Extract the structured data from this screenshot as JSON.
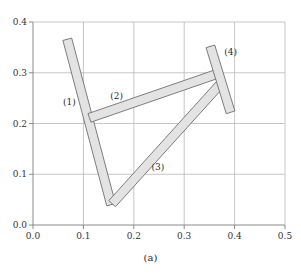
{
  "figure": {
    "caption": "(a)",
    "caption_x": 150,
    "caption_y": 252
  },
  "chart_data": {
    "type": "diagram",
    "title": "",
    "subtitle": "",
    "xlabel": "",
    "ylabel": "",
    "xlim": [
      0.0,
      0.5
    ],
    "ylim": [
      0.0,
      0.4
    ],
    "grid": true,
    "legend_position": "none",
    "xticks": [
      0.0,
      0.1,
      0.2,
      0.3,
      0.4,
      0.5
    ],
    "yticks": [
      0.0,
      0.1,
      0.2,
      0.3,
      0.4
    ],
    "xtick_labels": [
      "0.0",
      "0.1",
      "0.2",
      "0.3",
      "0.4",
      "0.5"
    ],
    "ytick_labels": [
      "0.0",
      "0.1",
      "0.2",
      "0.3",
      "0.4"
    ],
    "colors": {
      "bar_fill": "#e3e3e3",
      "bar_stroke": "#6f6f6f",
      "grid": "#b9b9b9",
      "axis": "#8a8a8a",
      "text": "#2b2b2b"
    },
    "bar_width": 0.018,
    "joints": [
      {
        "name": "A",
        "x": 0.118,
        "y": 0.205
      },
      {
        "name": "B",
        "x": 0.152,
        "y": 0.042
      },
      {
        "name": "C",
        "x": 0.364,
        "y": 0.298
      },
      {
        "name": "D",
        "x": 0.366,
        "y": 0.272
      }
    ],
    "links": [
      {
        "id": 1,
        "label": "(1)",
        "start": {
          "x": 0.068,
          "y": 0.366
        },
        "end": {
          "x": 0.155,
          "y": 0.04
        },
        "label_pos": {
          "x": 0.072,
          "y": 0.243
        }
      },
      {
        "id": 2,
        "label": "(2)",
        "start": {
          "x": 0.112,
          "y": 0.211
        },
        "end": {
          "x": 0.366,
          "y": 0.298
        },
        "label_pos": {
          "x": 0.166,
          "y": 0.255
        }
      },
      {
        "id": 3,
        "label": "(3)",
        "start": {
          "x": 0.157,
          "y": 0.042
        },
        "end": {
          "x": 0.372,
          "y": 0.278
        },
        "label_pos": {
          "x": 0.248,
          "y": 0.114
        }
      },
      {
        "id": 4,
        "label": "(4)",
        "start": {
          "x": 0.352,
          "y": 0.352
        },
        "end": {
          "x": 0.392,
          "y": 0.222
        },
        "label_pos": {
          "x": 0.392,
          "y": 0.341
        }
      }
    ]
  }
}
